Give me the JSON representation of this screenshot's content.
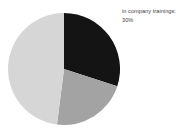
{
  "chart_data": {
    "type": "pie",
    "title": "",
    "categories": [
      "in company trainings",
      "segment-2",
      "segment-3"
    ],
    "values": [
      30,
      22,
      48
    ],
    "labels": [
      "30%",
      "",
      ""
    ],
    "colors": [
      "#141414",
      "#a3a3a3",
      "#d6d6d6"
    ],
    "start_angle": 0,
    "direction": "clockwise",
    "legend_position": "right",
    "grid": false,
    "annotations": [
      {
        "target": "in company trainings",
        "text": "in company trainings:",
        "value": "30%"
      }
    ]
  },
  "legend": {
    "label": "in company trainings:",
    "value": "30%"
  },
  "canvas": {
    "background": "#ffffff",
    "text_color": "#3d3d3d"
  }
}
